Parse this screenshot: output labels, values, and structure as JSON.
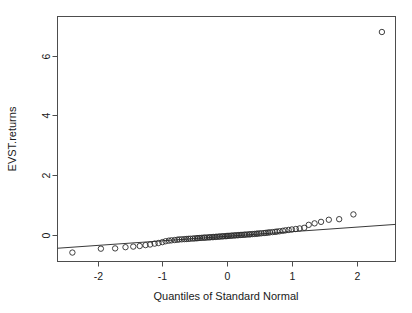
{
  "figure": {
    "type": "qq-plot",
    "background": "#ffffff",
    "frame_color": "#4d4d4d",
    "point_color": "#2b2b2b",
    "line_color": "#3a3a3a"
  },
  "chart_data": {
    "type": "scatter",
    "title": "",
    "subtitle": "",
    "xlabel": "Quantiles of Standard Normal",
    "ylabel": "EVST.returns",
    "xlim": [
      -2.62,
      2.6
    ],
    "ylim": [
      -0.9,
      7.32
    ],
    "xticks": [
      -2,
      -1,
      0,
      1,
      2
    ],
    "xtick_labels": [
      "-2",
      "-1",
      "0",
      "1",
      "2"
    ],
    "yticks": [
      0,
      2,
      4,
      6
    ],
    "ytick_labels": [
      "0",
      "2",
      "4",
      "6"
    ],
    "grid": false,
    "legend": null,
    "annotations": [],
    "reference_line": {
      "name": "qq-line",
      "x": [
        -2.62,
        2.6
      ],
      "y": [
        -0.455,
        0.345
      ],
      "slope": 0.1533,
      "intercept": -0.053
    },
    "series": [
      {
        "name": "EVST.returns quantiles",
        "marker": "open-circle",
        "x": [
          -2.39,
          -1.95,
          -1.73,
          -1.57,
          -1.45,
          -1.35,
          -1.26,
          -1.19,
          -1.12,
          -1.06,
          -1.0,
          -0.95,
          -0.9,
          -0.86,
          -0.81,
          -0.77,
          -0.74,
          -0.7,
          -0.66,
          -0.63,
          -0.6,
          -0.57,
          -0.53,
          -0.5,
          -0.47,
          -0.45,
          -0.42,
          -0.39,
          -0.36,
          -0.34,
          -0.31,
          -0.28,
          -0.26,
          -0.23,
          -0.21,
          -0.18,
          -0.16,
          -0.13,
          -0.11,
          -0.08,
          -0.06,
          -0.03,
          -0.01,
          0.01,
          0.03,
          0.06,
          0.08,
          0.11,
          0.13,
          0.16,
          0.18,
          0.21,
          0.23,
          0.26,
          0.28,
          0.31,
          0.34,
          0.36,
          0.39,
          0.42,
          0.45,
          0.47,
          0.5,
          0.53,
          0.57,
          0.6,
          0.63,
          0.66,
          0.7,
          0.74,
          0.77,
          0.81,
          0.86,
          0.9,
          0.95,
          1.0,
          1.06,
          1.12,
          1.19,
          1.26,
          1.35,
          1.45,
          1.57,
          1.73,
          1.95,
          2.39
        ],
        "y": [
          -0.6,
          -0.47,
          -0.46,
          -0.42,
          -0.4,
          -0.38,
          -0.35,
          -0.33,
          -0.3,
          -0.28,
          -0.25,
          -0.22,
          -0.2,
          -0.19,
          -0.18,
          -0.17,
          -0.16,
          -0.155,
          -0.15,
          -0.145,
          -0.14,
          -0.135,
          -0.13,
          -0.125,
          -0.12,
          -0.115,
          -0.11,
          -0.105,
          -0.1,
          -0.098,
          -0.095,
          -0.09,
          -0.086,
          -0.082,
          -0.078,
          -0.074,
          -0.07,
          -0.066,
          -0.062,
          -0.058,
          -0.054,
          -0.05,
          -0.046,
          -0.042,
          -0.038,
          -0.034,
          -0.03,
          -0.026,
          -0.022,
          -0.018,
          -0.014,
          -0.01,
          -0.006,
          -0.002,
          0.002,
          0.006,
          0.01,
          0.015,
          0.02,
          0.025,
          0.03,
          0.036,
          0.042,
          0.048,
          0.055,
          0.062,
          0.07,
          0.078,
          0.086,
          0.095,
          0.105,
          0.115,
          0.13,
          0.145,
          0.16,
          0.175,
          0.19,
          0.21,
          0.23,
          0.33,
          0.38,
          0.43,
          0.5,
          0.52,
          0.68,
          6.8
        ]
      }
    ]
  }
}
